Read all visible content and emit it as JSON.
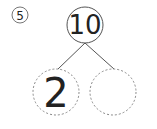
{
  "problem": {
    "number": "5"
  },
  "number_bond": {
    "whole": "10",
    "parts": [
      "2",
      ""
    ]
  },
  "colors": {
    "stroke": "#555555",
    "dashed": "#888888",
    "text": "#222222"
  }
}
